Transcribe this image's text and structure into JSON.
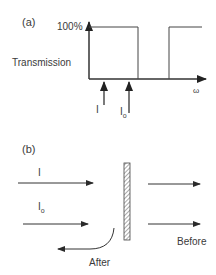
{
  "panel_a": {
    "label": "(a)",
    "y_axis_label": "Transmission",
    "y_tick": "100%",
    "x_axis_label": "ω",
    "arrows": [
      {
        "label": "I",
        "sub": ""
      },
      {
        "label": "I",
        "sub": "o"
      }
    ]
  },
  "panel_b": {
    "label": "(b)",
    "beam_labels": [
      {
        "label": "I",
        "sub": ""
      },
      {
        "label": "I",
        "sub": "o"
      }
    ],
    "after_label": "After",
    "before_label": "Before"
  },
  "colors": {
    "line": "#3a3a3a",
    "text": "#3a3a3a",
    "hatch": "#555555"
  }
}
